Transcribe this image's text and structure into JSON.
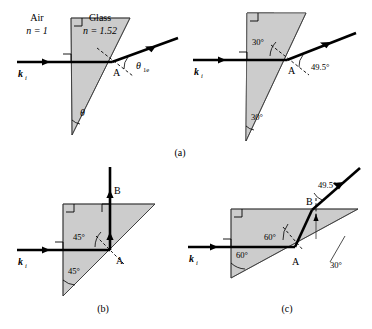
{
  "figure": {
    "panels": [
      {
        "id": "a-left",
        "caption": "",
        "labels": {
          "medium_outside": "Air",
          "index_outside": "n = 1",
          "medium_inside": "Glass",
          "index_inside": "n = 1.52",
          "incident_ray": "k",
          "incident_ray_sub": "i",
          "point": "A",
          "exit_angle": "θ",
          "exit_angle_sub": "1e",
          "apex_angle": "θ"
        }
      },
      {
        "id": "a-right",
        "caption": "",
        "labels": {
          "incident_ray": "k",
          "incident_ray_sub": "i",
          "point": "A",
          "internal_angle": "30°",
          "apex_angle": "30°",
          "exit_angle": "49.5°"
        }
      },
      {
        "id": "b",
        "caption": "(b)",
        "labels": {
          "incident_ray": "k",
          "incident_ray_sub": "i",
          "point_a": "A",
          "point_b": "B",
          "internal_angle": "45°",
          "apex_angle": "45°"
        }
      },
      {
        "id": "c",
        "caption": "(c)",
        "labels": {
          "incident_ray": "k",
          "incident_ray_sub": "i",
          "point_a": "A",
          "point_b": "B",
          "internal_angle": "60°",
          "apex_angle": "60°",
          "surface_angle": "30°",
          "exit_angle": "49.5°"
        }
      }
    ],
    "caption_a": "(a)",
    "colors": {
      "glass_fill": "#cccccc",
      "line": "#000000",
      "thin_line": "#555555"
    }
  }
}
